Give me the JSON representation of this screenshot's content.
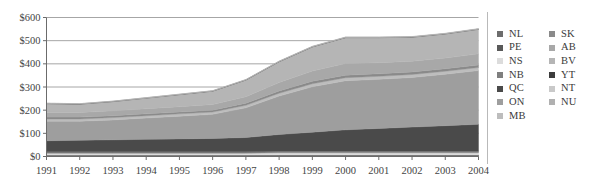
{
  "chart_data": {
    "type": "area",
    "stacked": true,
    "title": "",
    "xlabel": "",
    "ylabel": "",
    "ylim": [
      0,
      600
    ],
    "ytick_values": [
      0,
      100,
      200,
      300,
      400,
      500,
      600
    ],
    "ytick_labels": [
      "$0",
      "$100",
      "$200",
      "$300",
      "$400",
      "$500",
      "$600"
    ],
    "grid": true,
    "legend_position": "right",
    "x": [
      1991,
      1992,
      1993,
      1994,
      1995,
      1996,
      1997,
      1998,
      1999,
      2000,
      2001,
      2002,
      2003,
      2004
    ],
    "categories": [
      "1991",
      "1992",
      "1993",
      "1994",
      "1995",
      "1996",
      "1997",
      "1998",
      "1999",
      "2000",
      "2001",
      "2002",
      "2003",
      "2004"
    ],
    "series": [
      {
        "name": "NL",
        "color": "#6d6d6d",
        "values": [
          4,
          4,
          4,
          4,
          4,
          4,
          4,
          5,
          5,
          5,
          5,
          5,
          5,
          5
        ]
      },
      {
        "name": "PE",
        "color": "#595959",
        "values": [
          2,
          2,
          2,
          2,
          2,
          2,
          2,
          2,
          2,
          2,
          2,
          2,
          2,
          2
        ]
      },
      {
        "name": "NS",
        "color": "#dcdcdc",
        "values": [
          8,
          8,
          8,
          8,
          8,
          8,
          8,
          9,
          9,
          9,
          9,
          9,
          9,
          9
        ]
      },
      {
        "name": "NB",
        "color": "#7f7f7f",
        "values": [
          6,
          6,
          6,
          6,
          6,
          6,
          6,
          7,
          7,
          7,
          7,
          7,
          7,
          7
        ]
      },
      {
        "name": "QC",
        "color": "#4a4a4a",
        "values": [
          48,
          50,
          52,
          54,
          56,
          58,
          62,
          72,
          82,
          92,
          98,
          104,
          110,
          116
        ]
      },
      {
        "name": "ON",
        "color": "#9e9e9e",
        "values": [
          84,
          82,
          86,
          92,
          98,
          104,
          128,
          166,
          196,
          212,
          212,
          214,
          222,
          232
        ]
      },
      {
        "name": "MB",
        "color": "#bdbdbd",
        "values": [
          10,
          10,
          10,
          10,
          10,
          10,
          11,
          12,
          13,
          13,
          13,
          13,
          13,
          13
        ]
      },
      {
        "name": "SK",
        "color": "#8a8a8a",
        "values": [
          8,
          8,
          8,
          8,
          8,
          8,
          9,
          10,
          11,
          11,
          11,
          11,
          11,
          11
        ]
      },
      {
        "name": "AB",
        "color": "#a8a8a8",
        "values": [
          20,
          20,
          21,
          22,
          23,
          24,
          28,
          36,
          44,
          50,
          48,
          46,
          46,
          48
        ]
      },
      {
        "name": "BV",
        "color": "#b5b5b5",
        "values": [
          38,
          36,
          40,
          46,
          52,
          58,
          72,
          90,
          104,
          112,
          108,
          104,
          104,
          106
        ]
      },
      {
        "name": "YT",
        "color": "#3c3c3c",
        "values": [
          1,
          1,
          1,
          1,
          1,
          1,
          1,
          1,
          1,
          1,
          1,
          1,
          1,
          1
        ]
      },
      {
        "name": "NT",
        "color": "#c9c9c9",
        "values": [
          1,
          1,
          1,
          1,
          1,
          1,
          1,
          1,
          1,
          1,
          1,
          1,
          1,
          1
        ]
      },
      {
        "name": "NU",
        "color": "#b0b0b0",
        "values": [
          0,
          0,
          0,
          0,
          0,
          0,
          0,
          1,
          1,
          1,
          1,
          1,
          1,
          1
        ]
      }
    ],
    "totals": [
      230,
      228,
      239,
      254,
      277,
      294,
      337,
      412,
      476,
      521,
      516,
      517,
      532,
      552
    ]
  },
  "legend": {
    "column_1": [
      {
        "label": "NL",
        "color": "#6d6d6d"
      },
      {
        "label": "PE",
        "color": "#595959"
      },
      {
        "label": "NS",
        "color": "#dcdcdc"
      },
      {
        "label": "NB",
        "color": "#7f7f7f"
      },
      {
        "label": "QC",
        "color": "#4a4a4a"
      },
      {
        "label": "ON",
        "color": "#9e9e9e"
      },
      {
        "label": "MB",
        "color": "#bdbdbd"
      }
    ],
    "column_2": [
      {
        "label": "SK",
        "color": "#8a8a8a"
      },
      {
        "label": "AB",
        "color": "#a8a8a8"
      },
      {
        "label": "BV",
        "color": "#b5b5b5"
      },
      {
        "label": "YT",
        "color": "#3c3c3c"
      },
      {
        "label": "NT",
        "color": "#c9c9c9"
      },
      {
        "label": "NU",
        "color": "#b0b0b0"
      }
    ]
  },
  "colors": {
    "axis": "#6b6b6b",
    "grid": "#8f8f8f",
    "text": "#3a3a3a",
    "background": "#ffffff"
  }
}
